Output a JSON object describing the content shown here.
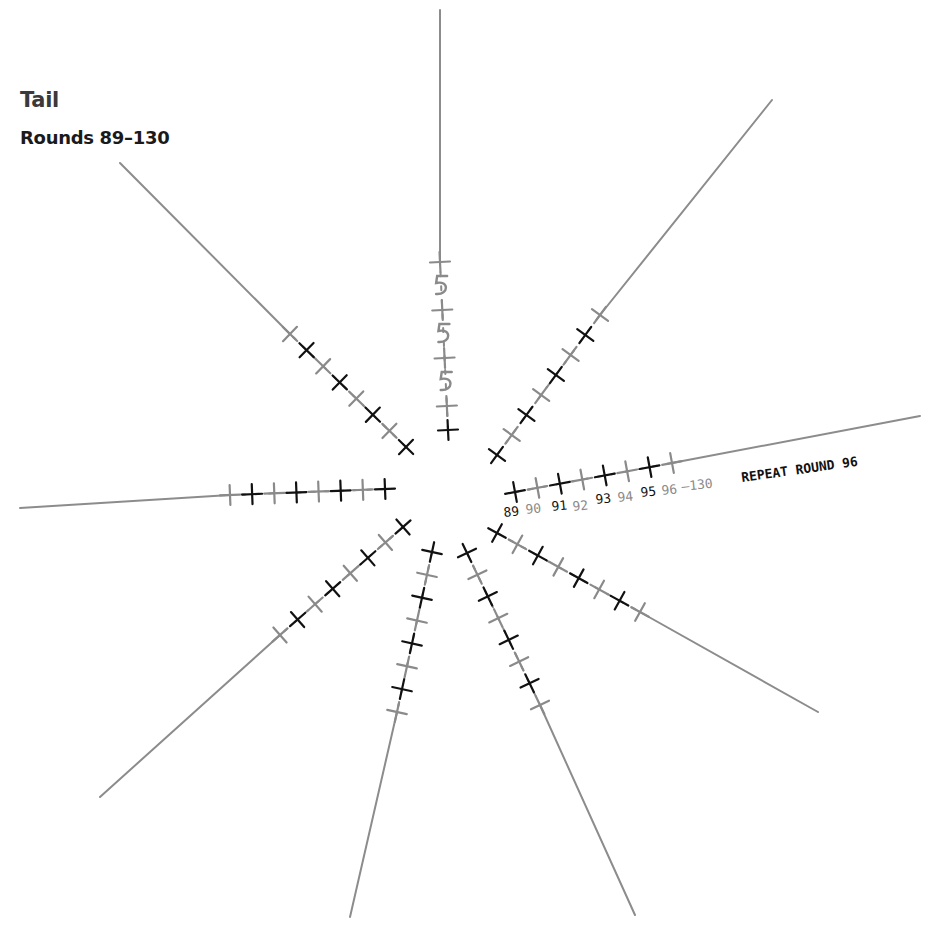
{
  "header": {
    "title": "Tail",
    "subtitle": "Rounds 89–130"
  },
  "colors": {
    "dark_stitch": "#111111",
    "light_stitch": "#8a8a8a",
    "spoke_line": "#8c8c8c"
  },
  "annotation": {
    "round_labels": [
      "89",
      "90",
      "91",
      "92",
      "93",
      "94",
      "95",
      "96"
    ],
    "range_suffix": "–130",
    "note": "REPEAT ROUND 96"
  },
  "spokes": [
    {
      "name": "top",
      "stitches": "alternating dark/light crosses with three loop (5-shaped) stitches"
    },
    {
      "name": "upper-right",
      "stitches": "8 alternating crosses"
    },
    {
      "name": "right",
      "stitches": "8 alternating crosses labelled 89-96"
    },
    {
      "name": "lower-right",
      "stitches": "8 alternating crosses"
    },
    {
      "name": "bottom-right",
      "stitches": "8 alternating crosses"
    },
    {
      "name": "bottom",
      "stitches": "8 alternating crosses"
    },
    {
      "name": "lower-left",
      "stitches": "8 alternating crosses"
    },
    {
      "name": "left",
      "stitches": "8 alternating crosses"
    },
    {
      "name": "upper-left",
      "stitches": "8 alternating crosses"
    }
  ]
}
